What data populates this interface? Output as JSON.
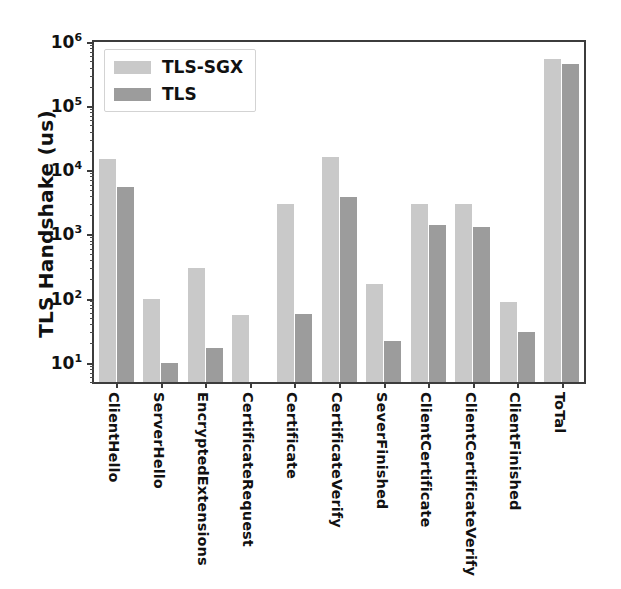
{
  "chart_data": {
    "type": "bar",
    "title": "",
    "xlabel": "",
    "ylabel": "TLS Handshake (us)",
    "yscale": "log",
    "ylim": [
      5,
      1000000
    ],
    "grid": false,
    "legend_position": "upper left",
    "ytick_labels": [
      "10¹",
      "10²",
      "10³",
      "10⁴",
      "10⁵",
      "10⁶"
    ],
    "ytick_values": [
      10,
      100,
      1000,
      10000,
      100000,
      1000000
    ],
    "categories": [
      "ClientHello",
      "ServerHello",
      "EncryptedExtensions",
      "CertificateRequest",
      "Certificate",
      "CertificateVerify",
      "SeverFinished",
      "ClientCertificate",
      "ClientCertificateVerify",
      "ClientFinished",
      "ToTal"
    ],
    "series": [
      {
        "name": "TLS-SGX",
        "color": "#c9c9c9",
        "values": [
          15000,
          100,
          300,
          55,
          3000,
          16000,
          170,
          3000,
          3000,
          90,
          550000
        ]
      },
      {
        "name": "TLS",
        "color": "#9c9c9c",
        "values": [
          5500,
          10,
          17,
          5,
          58,
          3800,
          22,
          1400,
          1300,
          30,
          450000
        ]
      }
    ]
  },
  "legend": {
    "items": [
      {
        "label": "TLS-SGX",
        "swatch": "sgx"
      },
      {
        "label": "TLS",
        "swatch": "tls"
      }
    ]
  },
  "axes": {
    "y_axis_label": "TLS Handshake (us)"
  },
  "colors": {
    "series_sgx": "#c9c9c9",
    "series_tls": "#9c9c9c",
    "axis": "#3c3c3c",
    "background": "#ffffff",
    "text": "#111111"
  }
}
